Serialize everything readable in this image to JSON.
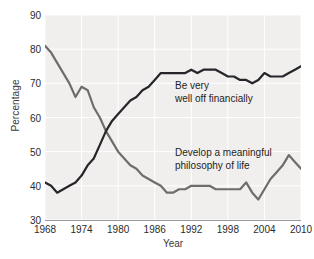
{
  "chart_data": {
    "type": "line",
    "title": "",
    "xlabel": "Year",
    "ylabel": "Percentage",
    "xlim": [
      1968,
      2010
    ],
    "ylim": [
      30,
      90
    ],
    "ytick_labels": [
      "30",
      "40",
      "50",
      "60",
      "70",
      "80",
      "90"
    ],
    "yticks": [
      30,
      40,
      50,
      60,
      70,
      80,
      90
    ],
    "xtick_labels": [
      "1968",
      "1974",
      "1980",
      "1986",
      "1992",
      "1998",
      "2004",
      "2010"
    ],
    "xticks": [
      1968,
      1974,
      1980,
      1986,
      1992,
      1998,
      2004,
      2010
    ],
    "grid": true,
    "legend_position": "inline-annotation",
    "x": [
      1968,
      1969,
      1970,
      1971,
      1972,
      1973,
      1974,
      1975,
      1976,
      1977,
      1978,
      1979,
      1980,
      1981,
      1982,
      1983,
      1984,
      1985,
      1986,
      1987,
      1988,
      1989,
      1990,
      1991,
      1992,
      1993,
      1994,
      1995,
      1996,
      1997,
      1998,
      1999,
      2000,
      2001,
      2002,
      2003,
      2004,
      2005,
      2006,
      2007,
      2008,
      2009,
      2010
    ],
    "series": [
      {
        "name": "Develop a meaningful philosophy of life",
        "color": "#6e6d6b",
        "values": [
          81,
          79,
          76,
          73,
          70,
          66,
          69,
          68,
          63,
          60,
          56,
          53,
          50,
          48,
          46,
          45,
          43,
          42,
          41,
          40,
          38,
          38,
          39,
          39,
          40,
          40,
          40,
          40,
          39,
          39,
          39,
          39,
          39,
          41,
          38,
          36,
          39,
          42,
          44,
          46,
          49,
          47,
          45
        ]
      },
      {
        "name": "Be very well off financially",
        "color": "#26262a",
        "values": [
          41,
          40,
          38,
          39,
          40,
          41,
          43,
          46,
          48,
          52,
          56,
          59,
          61,
          63,
          65,
          66,
          68,
          69,
          71,
          73,
          73,
          73,
          73,
          73,
          74,
          73,
          74,
          74,
          74,
          73,
          72,
          72,
          71,
          71,
          70,
          71,
          73,
          72,
          72,
          72,
          73,
          74,
          75
        ]
      }
    ],
    "annotations": [
      {
        "text": "Be very\nwell off financially",
        "x": 1993,
        "y": 68
      },
      {
        "text": "Develop a meaningful\nphilosophy of life",
        "x": 1993,
        "y": 48
      }
    ]
  }
}
